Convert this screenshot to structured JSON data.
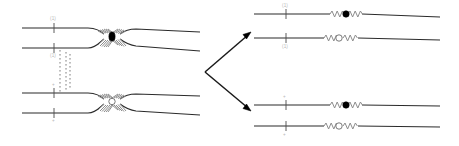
{
  "figure": {
    "background_color": "#ffffff",
    "width": 459,
    "height": 146,
    "colors": {
      "strand": "#2b2b2b",
      "crossing": "#8d8d8d",
      "squiggle": "#8d8d8d",
      "arrow": "#1a1a1a",
      "node_filled": "#000000",
      "node_open": "#ffffff",
      "label": "#b9b9b9",
      "dashed_guide": "#6f6f6f"
    }
  },
  "left_panel": {
    "name": "left-diagram",
    "groups": [
      {
        "name": "upper-left-group",
        "crossing_type": "filled",
        "strands": [
          {
            "name": "strand-1",
            "label": "(1)",
            "tick_label": "(1)"
          },
          {
            "name": "strand-2",
            "label": "(1)",
            "tick_label": "(1)"
          }
        ]
      },
      {
        "name": "lower-left-group",
        "crossing_type": "open",
        "strands": [
          {
            "name": "strand-3",
            "label": "+",
            "tick_label": "+"
          },
          {
            "name": "strand-4",
            "label": "+",
            "tick_label": "+"
          }
        ]
      }
    ],
    "guide": {
      "name": "vertical-dashed-guide",
      "style": "dotted"
    }
  },
  "arrow": {
    "name": "branching-arrow",
    "branches": [
      {
        "name": "arrow-branch-up",
        "direction": "up-right"
      },
      {
        "name": "arrow-branch-down",
        "direction": "down-right"
      }
    ]
  },
  "right_panels": [
    {
      "name": "upper-right-panel",
      "strands": [
        {
          "name": "strand-1",
          "tick_label": "(1)",
          "marker": "filled",
          "segment": "squiggle"
        },
        {
          "name": "strand-2",
          "tick_label": "(1)",
          "marker": "open",
          "segment": "squiggle"
        }
      ]
    },
    {
      "name": "lower-right-panel",
      "strands": [
        {
          "name": "strand-3",
          "tick_label": "+",
          "marker": "filled",
          "segment": "squiggle"
        },
        {
          "name": "strand-4",
          "tick_label": "+",
          "marker": "open",
          "segment": "squiggle"
        }
      ]
    }
  ]
}
